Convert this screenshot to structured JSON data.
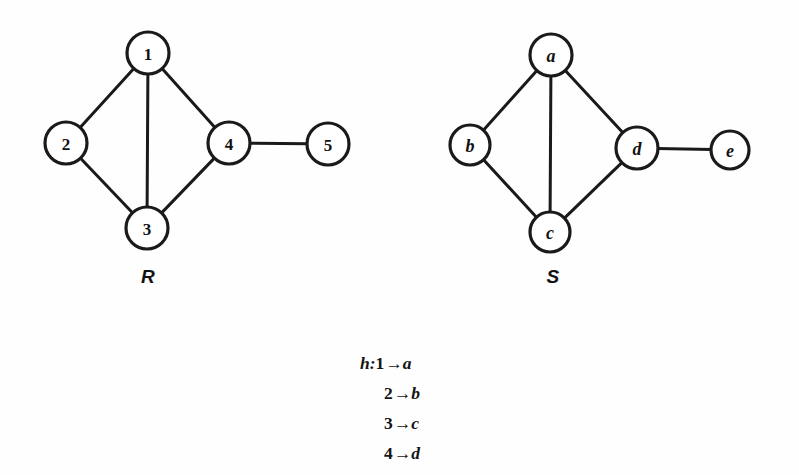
{
  "figure": {
    "background_color": "#fefefe",
    "ink_color": "#1a1a1a",
    "graphs": [
      {
        "caption": "R",
        "caption_x": 148,
        "caption_y": 277,
        "nodes": [
          {
            "id": "1",
            "label": "1",
            "x": 148,
            "y": 53,
            "r": 21,
            "italic": false
          },
          {
            "id": "2",
            "label": "2",
            "x": 66,
            "y": 143,
            "r": 21,
            "italic": false
          },
          {
            "id": "3",
            "label": "3",
            "x": 147,
            "y": 228,
            "r": 21,
            "italic": false
          },
          {
            "id": "4",
            "label": "4",
            "x": 229,
            "y": 143,
            "r": 21,
            "italic": false
          },
          {
            "id": "5",
            "label": "5",
            "x": 328,
            "y": 144,
            "r": 21,
            "italic": false
          }
        ],
        "edges": [
          {
            "from": "1",
            "to": "2"
          },
          {
            "from": "1",
            "to": "3"
          },
          {
            "from": "1",
            "to": "4"
          },
          {
            "from": "2",
            "to": "3"
          },
          {
            "from": "3",
            "to": "4"
          },
          {
            "from": "4",
            "to": "5"
          }
        ]
      },
      {
        "caption": "S",
        "caption_x": 553,
        "caption_y": 277,
        "nodes": [
          {
            "id": "a",
            "label": "a",
            "x": 551,
            "y": 55,
            "r": 21,
            "italic": true
          },
          {
            "id": "b",
            "label": "b",
            "x": 470,
            "y": 145,
            "r": 20,
            "italic": true
          },
          {
            "id": "c",
            "label": "c",
            "x": 550,
            "y": 232,
            "r": 20,
            "italic": true
          },
          {
            "id": "d",
            "label": "d",
            "x": 637,
            "y": 148,
            "r": 21,
            "italic": true
          },
          {
            "id": "e",
            "label": "e",
            "x": 730,
            "y": 150,
            "r": 19,
            "italic": true
          }
        ],
        "edges": [
          {
            "from": "a",
            "to": "b"
          },
          {
            "from": "a",
            "to": "c"
          },
          {
            "from": "a",
            "to": "d"
          },
          {
            "from": "b",
            "to": "c"
          },
          {
            "from": "c",
            "to": "d"
          },
          {
            "from": "d",
            "to": "e"
          }
        ]
      }
    ]
  },
  "mapping": {
    "function_name": "h",
    "colon": ":",
    "arrow": "→",
    "lines": [
      {
        "source": "1",
        "target": "a",
        "prefix": "h:"
      },
      {
        "source": "2",
        "target": "b",
        "prefix": ""
      },
      {
        "source": "3",
        "target": "c",
        "prefix": ""
      },
      {
        "source": "4",
        "target": "d",
        "prefix": ""
      }
    ]
  }
}
